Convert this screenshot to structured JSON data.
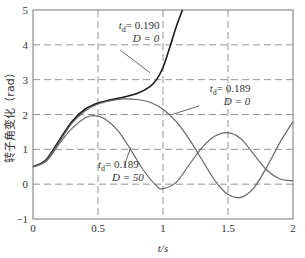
{
  "chart_data": {
    "type": "line",
    "title": "",
    "xlabel": "t/s",
    "ylabel": "转子角变化（rad）",
    "xlim": [
      0,
      2
    ],
    "ylim": [
      -1,
      5
    ],
    "xticks": [
      0,
      0.5,
      1,
      1.5,
      2
    ],
    "xtick_labels": [
      "0",
      "0.5",
      "1",
      "1.5",
      "2"
    ],
    "yticks": [
      -1,
      0,
      1,
      2,
      3,
      4,
      5
    ],
    "ytick_labels": [
      "−1",
      "0",
      "1",
      "2",
      "3",
      "4",
      "5"
    ],
    "grid": true,
    "grid_style": "dashed",
    "series": [
      {
        "name": "t_d=0.190, D=0",
        "color": "#1a1a1a",
        "width": 1.6,
        "x": [
          0,
          0.1,
          0.2,
          0.3,
          0.4,
          0.5,
          0.6,
          0.7,
          0.8,
          0.9,
          0.95,
          1.0,
          1.05,
          1.1,
          1.15
        ],
        "y": [
          0.5,
          0.7,
          1.25,
          1.8,
          2.15,
          2.33,
          2.42,
          2.5,
          2.6,
          2.8,
          3.0,
          3.35,
          3.9,
          4.5,
          5.0
        ]
      },
      {
        "name": "t_d=0.189, D=0",
        "color": "#666666",
        "width": 1.2,
        "x": [
          0,
          0.1,
          0.2,
          0.3,
          0.4,
          0.5,
          0.6,
          0.7,
          0.8,
          0.9,
          1.0,
          1.1,
          1.2,
          1.3,
          1.4,
          1.5,
          1.6,
          1.7,
          1.8,
          1.9,
          2.0
        ],
        "y": [
          0.5,
          0.68,
          1.2,
          1.75,
          2.1,
          2.3,
          2.4,
          2.45,
          2.43,
          2.35,
          2.15,
          1.8,
          1.3,
          0.7,
          0.1,
          -0.3,
          -0.38,
          -0.1,
          0.5,
          1.2,
          1.8
        ]
      },
      {
        "name": "t_d=0.189, D=50",
        "color": "#666666",
        "width": 1.2,
        "x": [
          0,
          0.1,
          0.2,
          0.3,
          0.4,
          0.47,
          0.55,
          0.65,
          0.75,
          0.85,
          0.95,
          1.0,
          1.1,
          1.2,
          1.3,
          1.4,
          1.5,
          1.6,
          1.7,
          1.8,
          1.9,
          2.0
        ],
        "y": [
          0.5,
          0.65,
          1.15,
          1.6,
          1.9,
          1.97,
          1.88,
          1.55,
          1.0,
          0.4,
          -0.05,
          -0.13,
          0.05,
          0.55,
          1.05,
          1.38,
          1.48,
          1.3,
          0.85,
          0.4,
          0.15,
          0.1
        ]
      }
    ],
    "annotations": [
      {
        "sub": "d",
        "td_label": "t",
        "td_value": "= 0.190",
        "d_line": "D = 0",
        "x": 0.66,
        "y": 4.45
      },
      {
        "sub": "d",
        "td_label": "t",
        "td_value": "= 0.189",
        "d_line": "D = 0",
        "x": 1.36,
        "y": 2.65
      },
      {
        "sub": "d",
        "td_label": "t",
        "td_value": "= 0.189",
        "d_line": "D = 50",
        "x": 0.5,
        "y": 0.45
      }
    ]
  }
}
